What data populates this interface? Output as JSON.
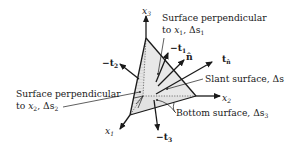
{
  "diagram": {
    "type": "tetrahedron-stress-element",
    "axes": {
      "x1": {
        "label": "x",
        "sub": "1"
      },
      "x2": {
        "label": "x",
        "sub": "2"
      },
      "x3": {
        "label": "x",
        "sub": "3"
      }
    },
    "vectors": {
      "neg_t1": {
        "label": "−t",
        "sub": "1"
      },
      "neg_t2": {
        "label": "−t",
        "sub": "2"
      },
      "neg_t3": {
        "label": "−t",
        "sub": "3"
      },
      "n_hat": {
        "label": "n̂"
      },
      "t_n": {
        "label": "t",
        "sub": "n̂"
      }
    },
    "callouts": {
      "surface_x1": {
        "line1": "Surface perpendicular",
        "line2_prefix": "to ",
        "line2_var": "x",
        "line2_var_sub": "1",
        "line2_mid": ", Δs",
        "line2_sub": "1"
      },
      "surface_x2": {
        "line1": "Surface perpendicular",
        "line2_prefix": "to ",
        "line2_var": "x",
        "line2_var_sub": "2",
        "line2_mid": ", Δs",
        "line2_sub": "2"
      },
      "slant": {
        "text": "Slant surface, Δs"
      },
      "bottom": {
        "text": "Bottom surface, Δs",
        "sub": "3"
      }
    },
    "colors": {
      "ink": "#1a1a1a",
      "face_fill": "#e6e6e6",
      "face_fill_dark": "#d6d6d6",
      "background": "#ffffff"
    }
  }
}
